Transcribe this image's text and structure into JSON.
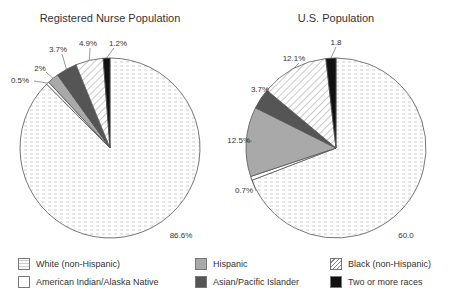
{
  "chart_data": [
    {
      "type": "pie",
      "title": "Registered Nurse Population",
      "categories": [
        "White (non-Hispanic)",
        "American Indian/Alaska Native",
        "Hispanic",
        "Asian/Pacific Islander",
        "Black (non-Hispanic)",
        "Two or more races"
      ],
      "values": [
        86.6,
        0.5,
        2.0,
        3.7,
        4.9,
        1.2
      ],
      "labels": [
        "86.6%",
        "0.5%",
        "2%",
        "3.7%",
        "4.9%",
        "1.2%"
      ]
    },
    {
      "type": "pie",
      "title": "U.S. Population",
      "categories": [
        "White (non-Hispanic)",
        "American Indian/Alaska Native",
        "Hispanic",
        "Asian/Pacific Islander",
        "Black (non-Hispanic)",
        "Two or more races"
      ],
      "values": [
        69.1,
        0.7,
        12.5,
        3.7,
        12.1,
        1.8
      ],
      "labels": [
        "60.0",
        "0.7%",
        "12.5%",
        "3.7%",
        "12.1%",
        "1.8"
      ]
    }
  ],
  "legend": [
    {
      "label": "White  (non-Hispanic)",
      "pattern": "dots"
    },
    {
      "label": "Hispanic",
      "pattern": "gray"
    },
    {
      "label": "Black (non-Hispanic)",
      "pattern": "hatch"
    },
    {
      "label": "American Indian/Alaska Native",
      "pattern": "white"
    },
    {
      "label": "Asian/Pacific Islander",
      "pattern": "darkgray"
    },
    {
      "label": "Two or more races",
      "pattern": "black"
    }
  ],
  "colors": {
    "white_fill": "#ffffff",
    "hispanic": "#a9a9a9",
    "asian": "#555555",
    "two_or_more": "#111111",
    "outline": "#555555"
  }
}
